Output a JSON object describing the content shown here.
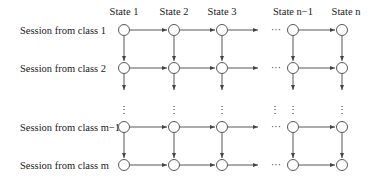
{
  "diagram": {
    "type": "state-transition-grid",
    "columns": [
      {
        "label": "State 1",
        "x": 124
      },
      {
        "label": "State 2",
        "x": 174
      },
      {
        "label": "State 3",
        "x": 222
      },
      {
        "label": "State n−1",
        "x": 293
      },
      {
        "label": "State n",
        "x": 342
      }
    ],
    "rows": [
      {
        "label": "Session from class 1",
        "y": 30
      },
      {
        "label": "Session from class 2",
        "y": 68
      },
      {
        "label": "Session from class m−1",
        "y": 127
      },
      {
        "label": "Session from class m",
        "y": 165
      }
    ],
    "ellipsis_horizontal": "···",
    "ellipsis_vertical": "⋮",
    "colors": {
      "stroke": "#444444",
      "text": "#1a1a1a",
      "background": "#ffffff"
    }
  }
}
